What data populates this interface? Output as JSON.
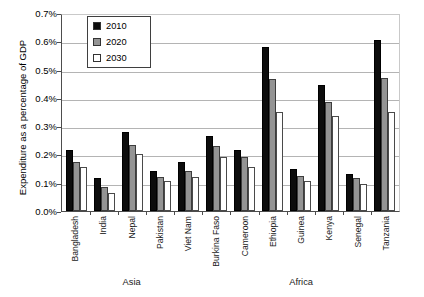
{
  "chart_data": {
    "type": "bar",
    "title": "",
    "xlabel": "",
    "ylabel": "Expenditure as a percentage of GDP",
    "ylim": [
      0.0,
      0.7
    ],
    "ytick_labels": [
      "0.7%",
      "0.6%",
      "0.5%",
      "0.4%",
      "0.3%",
      "0.2%",
      "0.1%",
      "0.0%"
    ],
    "ytick_values": [
      0.7,
      0.6,
      0.5,
      0.4,
      0.3,
      0.2,
      0.1,
      0.0
    ],
    "grid": true,
    "legend_position": "top-left",
    "categories": [
      "Bangladesh",
      "India",
      "Nepal",
      "Pakistan",
      "Viet Nam",
      "Burkina Faso",
      "Cameroon",
      "Ethiopia",
      "Guinea",
      "Kenya",
      "Senegal",
      "Tanzania"
    ],
    "series": [
      {
        "name": "2010",
        "color": "#0d0d0d",
        "values": [
          0.215,
          0.115,
          0.28,
          0.14,
          0.175,
          0.265,
          0.215,
          0.58,
          0.15,
          0.445,
          0.13,
          0.605
        ]
      },
      {
        "name": "2020",
        "color": "#949494",
        "values": [
          0.175,
          0.085,
          0.235,
          0.12,
          0.14,
          0.23,
          0.19,
          0.465,
          0.125,
          0.385,
          0.115,
          0.47
        ]
      },
      {
        "name": "2030",
        "color": "#ffffff",
        "values": [
          0.155,
          0.065,
          0.2,
          0.105,
          0.12,
          0.19,
          0.155,
          0.35,
          0.105,
          0.335,
          0.095,
          0.35
        ]
      }
    ],
    "group_labels": [
      {
        "label": "Asia",
        "categories": [
          "Bangladesh",
          "India",
          "Nepal",
          "Pakistan",
          "Viet Nam"
        ]
      },
      {
        "label": "Africa",
        "categories": [
          "Burkina Faso",
          "Cameroon",
          "Ethiopia",
          "Guinea",
          "Kenya",
          "Senegal",
          "Tanzania"
        ]
      }
    ]
  },
  "legend": {
    "items": [
      {
        "label": "2010",
        "swatch": "#0d0d0d"
      },
      {
        "label": "2020",
        "swatch": "#949494"
      },
      {
        "label": "2030",
        "swatch": "#ffffff"
      }
    ]
  }
}
